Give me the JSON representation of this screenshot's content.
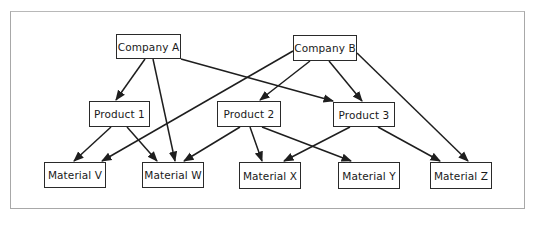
{
  "diagram": {
    "type": "directed-graph",
    "nodes": [
      {
        "id": "companyA",
        "label": "Company A",
        "level": "company",
        "x": 116,
        "y": 34,
        "w": 65,
        "h": 25
      },
      {
        "id": "companyB",
        "label": "Company B",
        "level": "company",
        "x": 293,
        "y": 35,
        "w": 64,
        "h": 26
      },
      {
        "id": "product1",
        "label": "Product 1",
        "level": "product",
        "x": 89,
        "y": 101,
        "w": 61,
        "h": 26
      },
      {
        "id": "product2",
        "label": "Product 2",
        "level": "product",
        "x": 217,
        "y": 101,
        "w": 64,
        "h": 26
      },
      {
        "id": "product3",
        "label": "Product 3",
        "level": "product",
        "x": 333,
        "y": 102,
        "w": 62,
        "h": 25
      },
      {
        "id": "materialV",
        "label": "Material V",
        "level": "material",
        "x": 44,
        "y": 162,
        "w": 62,
        "h": 26
      },
      {
        "id": "materialW",
        "label": "Material W",
        "level": "material",
        "x": 142,
        "y": 162,
        "w": 62,
        "h": 26
      },
      {
        "id": "materialX",
        "label": "Material X",
        "level": "material",
        "x": 239,
        "y": 162,
        "w": 62,
        "h": 27
      },
      {
        "id": "materialY",
        "label": "Material Y",
        "level": "material",
        "x": 338,
        "y": 162,
        "w": 62,
        "h": 27
      },
      {
        "id": "materialZ",
        "label": "Material Z",
        "level": "material",
        "x": 430,
        "y": 162,
        "w": 62,
        "h": 27
      }
    ],
    "edges": [
      {
        "from": "companyA",
        "to": "product1",
        "x1": 145,
        "y1": 59,
        "x2": 116,
        "y2": 100
      },
      {
        "from": "companyA",
        "to": "materialW",
        "x1": 153,
        "y1": 59,
        "x2": 175,
        "y2": 161
      },
      {
        "from": "companyA",
        "to": "product3",
        "x1": 181,
        "y1": 59,
        "x2": 333,
        "y2": 101
      },
      {
        "from": "companyB",
        "to": "materialV",
        "x1": 293,
        "y1": 51,
        "x2": 102,
        "y2": 161
      },
      {
        "from": "companyB",
        "to": "product2",
        "x1": 310,
        "y1": 61,
        "x2": 260,
        "y2": 100
      },
      {
        "from": "companyB",
        "to": "product3",
        "x1": 329,
        "y1": 61,
        "x2": 362,
        "y2": 101
      },
      {
        "from": "companyB",
        "to": "materialZ",
        "x1": 357,
        "y1": 53,
        "x2": 468,
        "y2": 161
      },
      {
        "from": "product1",
        "to": "materialV",
        "x1": 111,
        "y1": 127,
        "x2": 74,
        "y2": 161
      },
      {
        "from": "product1",
        "to": "materialW",
        "x1": 127,
        "y1": 127,
        "x2": 157,
        "y2": 161
      },
      {
        "from": "product2",
        "to": "materialW",
        "x1": 240,
        "y1": 127,
        "x2": 184,
        "y2": 161
      },
      {
        "from": "product2",
        "to": "materialX",
        "x1": 250,
        "y1": 127,
        "x2": 262,
        "y2": 161
      },
      {
        "from": "product2",
        "to": "materialY",
        "x1": 262,
        "y1": 127,
        "x2": 351,
        "y2": 161
      },
      {
        "from": "product3",
        "to": "materialX",
        "x1": 350,
        "y1": 127,
        "x2": 284,
        "y2": 161
      },
      {
        "from": "product3",
        "to": "materialZ",
        "x1": 378,
        "y1": 127,
        "x2": 440,
        "y2": 161
      }
    ]
  },
  "caption": {
    "text": ""
  },
  "colors": {
    "stroke": "#1e1e1e",
    "frame": "#a8a8a8",
    "background": "#ffffff"
  }
}
